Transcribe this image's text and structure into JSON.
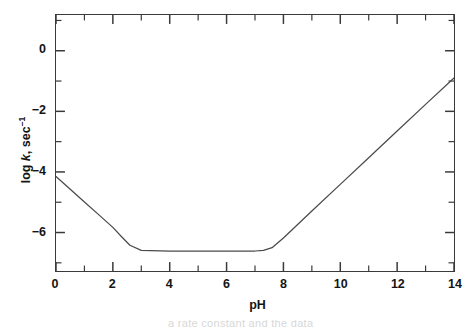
{
  "figure": {
    "background_color": "#ffffff",
    "line_color": "#4a4a4a",
    "axis_color": "#3a3a3a",
    "text_color": "#141414"
  },
  "axis_titles": {
    "x": "pH",
    "y_prefix": "log ",
    "y_italic": "k",
    "y_suffix": ", sec",
    "y_superscript": "-1",
    "y_full": "log k, sec-1"
  },
  "x_ticks": {
    "major_values": [
      0,
      2,
      4,
      6,
      8,
      10,
      12,
      14
    ],
    "major_labels": [
      "0",
      "2",
      "4",
      "6",
      "8",
      "10",
      "12",
      "14"
    ],
    "minor_values": [
      1,
      3,
      5,
      7,
      9,
      11,
      13
    ]
  },
  "y_ticks": {
    "major_values": [
      0,
      -2,
      -4,
      -6
    ],
    "major_labels": [
      "0",
      "-2",
      "-4",
      "-6"
    ],
    "minor_values": [
      1,
      -1,
      -3,
      -5,
      -7
    ]
  },
  "caption": {
    "cut_off_text": "a rate constant and the data"
  },
  "chart_data": {
    "type": "line",
    "title": "",
    "subtitle": "",
    "xlabel": "pH",
    "ylabel": "log k, sec-1",
    "xlim": [
      0,
      14
    ],
    "ylim": [
      -7.27,
      1.18
    ],
    "grid": false,
    "legend": "none",
    "series": [
      {
        "name": "log k vs pH",
        "color": "#4a4a4a",
        "x": [
          0.0,
          0.5,
          1.0,
          1.5,
          2.0,
          2.3,
          2.6,
          3.0,
          4.0,
          5.0,
          6.0,
          7.0,
          7.3,
          7.6,
          8.0,
          9.0,
          10.0,
          11.0,
          12.0,
          13.0,
          14.0
        ],
        "y": [
          -4.15,
          -4.57,
          -4.99,
          -5.41,
          -5.83,
          -6.13,
          -6.42,
          -6.59,
          -6.61,
          -6.61,
          -6.61,
          -6.61,
          -6.59,
          -6.5,
          -6.18,
          -5.29,
          -4.41,
          -3.53,
          -2.65,
          -1.77,
          -0.9
        ]
      }
    ],
    "annotations": {
      "descending_branch_slope": -0.84,
      "plateau_value": -6.61,
      "plateau_range": [
        2.6,
        7.3
      ],
      "ascending_branch_slope": 0.88,
      "left_endpoint": [
        0,
        -4.15
      ],
      "right_endpoint": [
        14,
        -0.9
      ],
      "minimum_value": -6.61
    }
  }
}
